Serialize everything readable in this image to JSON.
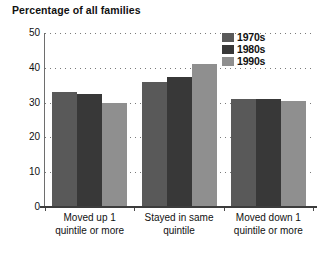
{
  "chart_data": {
    "type": "bar",
    "title": "Percentage of all families",
    "xlabel": "",
    "ylabel": "",
    "ylim": [
      0,
      50
    ],
    "yticks": [
      0,
      10,
      20,
      30,
      40,
      50
    ],
    "grid": true,
    "legend_position": "top-right",
    "categories": [
      "Moved up 1 quintile or more",
      "Stayed in same quintile",
      "Moved down 1 quintile or more"
    ],
    "category_lines": [
      [
        "Moved up 1",
        "quintile or more"
      ],
      [
        "Stayed in same",
        "quintile"
      ],
      [
        "Moved down 1",
        "quintile or more"
      ]
    ],
    "series": [
      {
        "name": "1970s",
        "color": "#595959",
        "values": [
          33,
          36,
          31
        ]
      },
      {
        "name": "1980s",
        "color": "#383838",
        "values": [
          32.5,
          37.5,
          31
        ]
      },
      {
        "name": "1990s",
        "color": "#8f8f8f",
        "values": [
          30,
          41,
          30.5
        ]
      }
    ]
  },
  "colors": {
    "series_1970s": "#595959",
    "series_1980s": "#383838",
    "series_1990s": "#8f8f8f",
    "axis": "#3c3c3c",
    "grid": "#7a7a7a",
    "text": "#111111",
    "background": "#ffffff"
  }
}
